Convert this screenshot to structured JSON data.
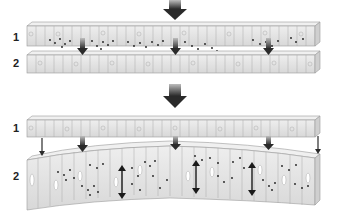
{
  "panels": [
    {
      "id": "top",
      "layers": [
        {
          "label": "1",
          "label_y": 38
        },
        {
          "label": "2",
          "label_y": 64
        }
      ]
    },
    {
      "id": "bottom",
      "layers": [
        {
          "label": "1",
          "label_y": 129
        },
        {
          "label": "2",
          "label_y": 177
        }
      ]
    }
  ],
  "colors": {
    "cell_fill": "#e4e4e4",
    "cell_top": "#ececec",
    "cell_stroke": "#9a9a9a",
    "arrow": "#3a3a3a",
    "dot": "#1a1a1a"
  }
}
